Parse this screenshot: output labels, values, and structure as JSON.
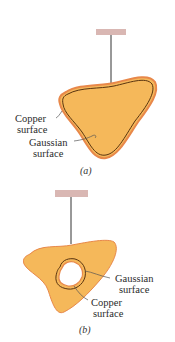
{
  "figure": {
    "colors": {
      "copper_fill": "#F5B85A",
      "copper_edge": "#E8884A",
      "gaussian_line": "#5A3410",
      "support": "#D9B7B3",
      "wire": "#333333",
      "cavity": "#FFFFFF"
    },
    "panel_a": {
      "caption": "(a)",
      "labels": {
        "copper_line1": "Copper",
        "copper_line2": "surface",
        "gaussian_line1": "Gaussian",
        "gaussian_line2": "surface"
      }
    },
    "panel_b": {
      "caption": "(b)",
      "labels": {
        "gaussian_line1": "Gaussian",
        "gaussian_line2": "surface",
        "copper_line1": "Copper",
        "copper_line2": "surface"
      }
    }
  }
}
